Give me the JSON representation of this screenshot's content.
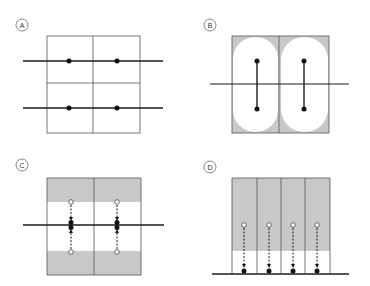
{
  "figure": {
    "colors": {
      "line": "#1a1a1a",
      "box": "#555555",
      "shade": "#c8c8c8",
      "white": "#ffffff"
    },
    "panels": [
      {
        "id": "A",
        "label": "A",
        "description": "Two horizontal lines crossing a 2x2 grid, one dot per cell on each line"
      },
      {
        "id": "B",
        "label": "B",
        "description": "Two cells with rounded white regions; each has a vertical segment joining two dots across a horizontal line"
      },
      {
        "id": "C",
        "label": "C",
        "description": "Two cells with shaded top and bottom bands; open circles with dashed arrows converging onto filled dots on the horizontal line"
      },
      {
        "id": "D",
        "label": "D",
        "description": "Four shaded columns; open circles with dashed arrows pointing down to filled dots on a baseline"
      }
    ]
  }
}
